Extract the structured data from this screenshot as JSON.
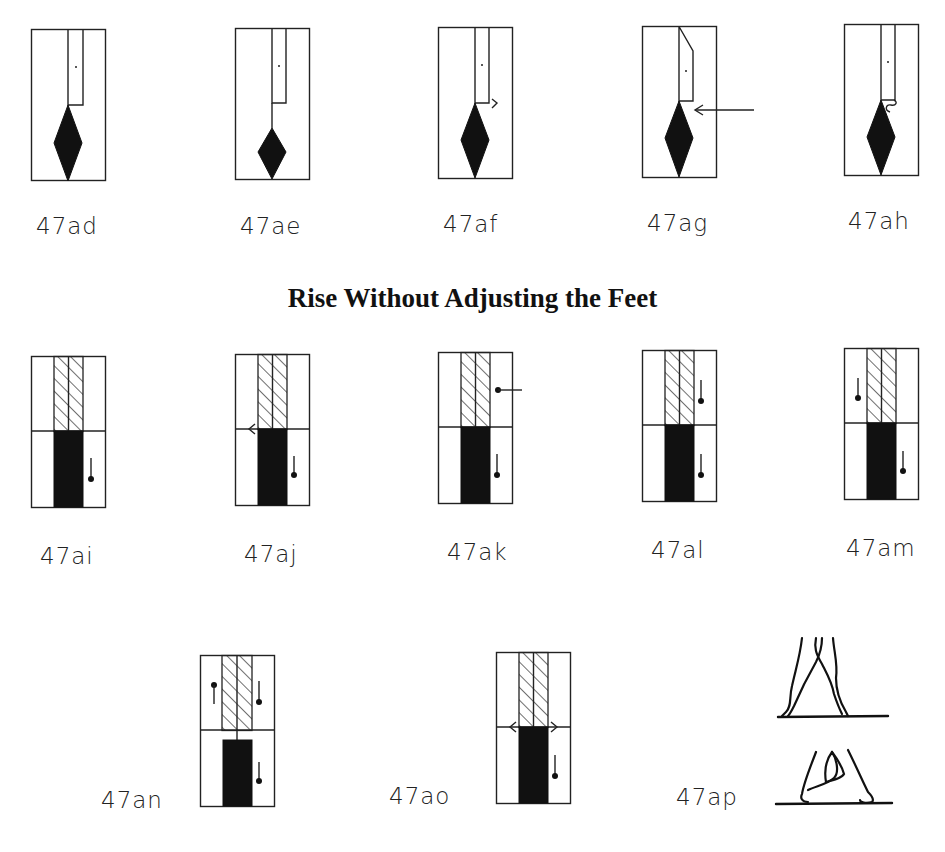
{
  "section_heading": "Rise Without Adjusting the Feet",
  "row1": {
    "figures": [
      {
        "id": "47ad",
        "label": "47ad"
      },
      {
        "id": "47ae",
        "label": "47ae"
      },
      {
        "id": "47af",
        "label": "47af"
      },
      {
        "id": "47ag",
        "label": "47ag"
      },
      {
        "id": "47ah",
        "label": "47ah"
      }
    ]
  },
  "row2": {
    "figures": [
      {
        "id": "47ai",
        "label": "47ai"
      },
      {
        "id": "47aj",
        "label": "47aj"
      },
      {
        "id": "47ak",
        "label": "47ak"
      },
      {
        "id": "47al",
        "label": "47al"
      },
      {
        "id": "47am",
        "label": "47am"
      }
    ]
  },
  "row3": {
    "figures": [
      {
        "id": "47an",
        "label": "47an"
      },
      {
        "id": "47ao",
        "label": "47ao"
      },
      {
        "id": "47ap",
        "label": "47ap"
      }
    ]
  },
  "colors": {
    "ink": "#111111",
    "paper": "#ffffff"
  }
}
